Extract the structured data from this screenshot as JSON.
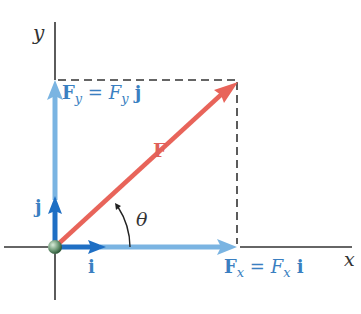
{
  "diagram": {
    "axes": {
      "x_label": "x",
      "y_label": "y"
    },
    "vectors": {
      "F": {
        "label": "F",
        "color": "#e8645a"
      },
      "Fx": {
        "label_bold": "F",
        "label_sub": "x",
        "eq": " = ",
        "label_italic": "F",
        "label_italic_sub": "x",
        "unit": " i",
        "color": "#7ab4e2"
      },
      "Fy": {
        "label_bold": "F",
        "label_sub": "y",
        "eq": " = ",
        "label_italic": "F",
        "label_italic_sub": "y",
        "unit": " j",
        "color": "#7ab4e2"
      },
      "i": {
        "label": "i",
        "color": "#1f6fc4"
      },
      "j": {
        "label": "j",
        "color": "#1f6fc4"
      }
    },
    "angle": {
      "label": "θ"
    },
    "colors": {
      "axis": "#333333",
      "label_blue": "#3a7fc1",
      "dash": "#333333"
    }
  }
}
